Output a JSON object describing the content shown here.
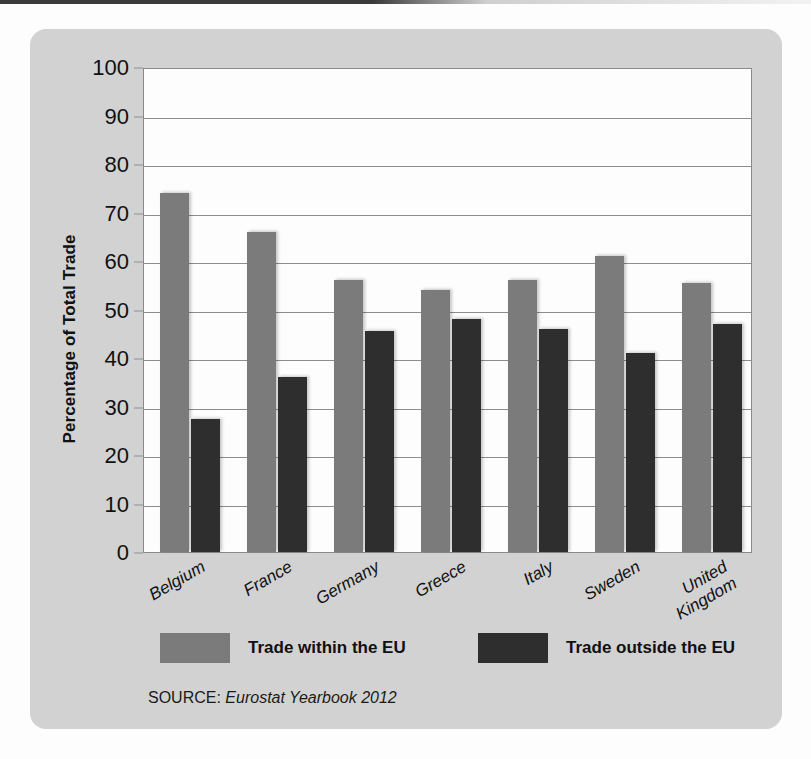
{
  "chart_data": {
    "type": "bar",
    "title": "",
    "xlabel": "",
    "ylabel": "Percentage of Total Trade",
    "ylim": [
      0,
      100
    ],
    "ytick_step": 10,
    "yticks": [
      "0",
      "10",
      "20",
      "30",
      "40",
      "50",
      "60",
      "70",
      "80",
      "90",
      "100"
    ],
    "grid": true,
    "legend_position": "bottom",
    "categories": [
      "Belgium",
      "France",
      "Germany",
      "Greece",
      "Italy",
      "Sweden",
      "United\nKingdom"
    ],
    "series": [
      {
        "name": "Trade within the EU",
        "color": "#7b7b7b",
        "values": [
          74,
          66,
          56,
          54,
          56,
          61,
          55.5
        ]
      },
      {
        "name": "Trade outside the EU",
        "color": "#2e2e2e",
        "values": [
          27.5,
          36,
          45.5,
          48,
          46,
          41,
          47
        ]
      }
    ],
    "source_label": "SOURCE:",
    "source_title": "Eurostat Yearbook 2012"
  },
  "colors": {
    "card_background": "#d2d2d2",
    "plot_background": "#fdfdfd",
    "gridline": "#8d8d8d",
    "axis": "#8a8a8a",
    "text": "#111111",
    "series_within": "#7b7b7b",
    "series_outside": "#2e2e2e"
  }
}
